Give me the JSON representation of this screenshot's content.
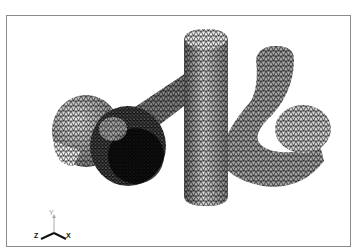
{
  "viewport": {
    "name": "3D mesh viewport",
    "model": "wireframe pipe mesh",
    "render_mode": "wireframe",
    "frame_color": "#8a8a8a",
    "mesh_color": "#111111",
    "background": "#ffffff"
  },
  "triad": {
    "x_label": "X",
    "y_label": "Y",
    "z_label": "Z"
  }
}
